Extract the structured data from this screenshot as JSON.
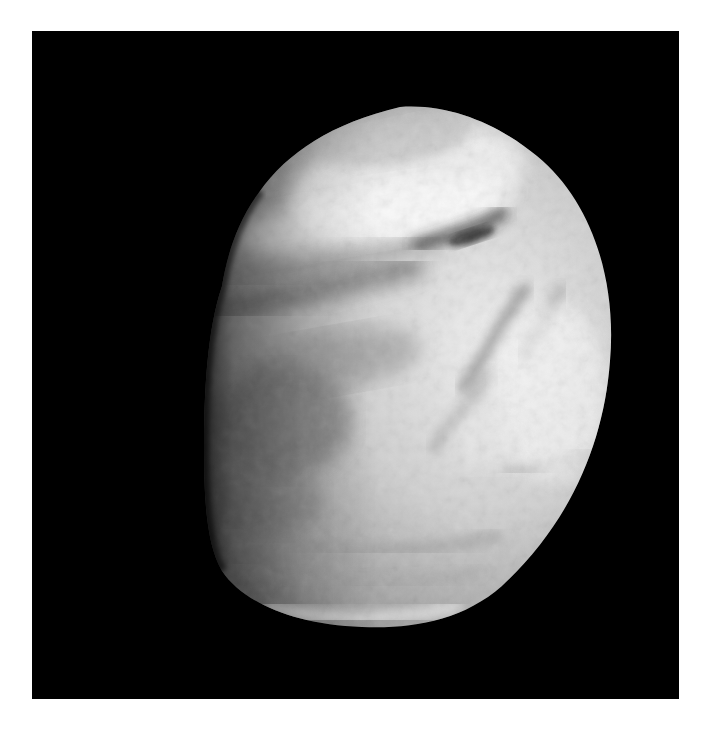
{
  "image": {
    "subject": "Venus cloud tops",
    "alt": "Grayscale image of the planet Venus showing swirling cloud bands against a black background",
    "background_color": "#000000",
    "border_color": "#ffffff",
    "planet": {
      "tone": "grayscale",
      "highlight_color": "#f2f2f2",
      "midtone_color": "#a8a8a8",
      "shadow_color": "#5a5a5a",
      "features": [
        "bright polar hood at top",
        "dark diagonal streak near upper right",
        "dark band across upper-left",
        "mottled bright region on right side",
        "banded clouds at bottom limb"
      ]
    }
  }
}
